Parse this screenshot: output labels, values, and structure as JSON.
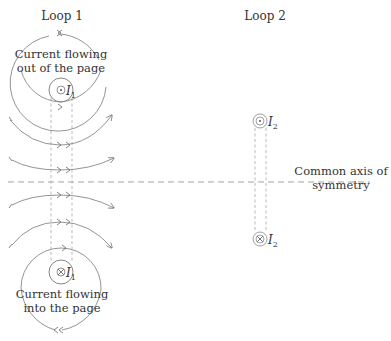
{
  "diagram": {
    "loop1": {
      "title": "Loop 1",
      "top_label_line1": "Current flowing",
      "top_label_line2": "out of the page",
      "bottom_label_line1": "Current flowing",
      "bottom_label_line2": "into the page",
      "top_current": "I",
      "top_current_sub": "1",
      "bottom_current": "I",
      "bottom_current_sub": "1",
      "top_symbol": "dot-in-circle (out of page)",
      "bottom_symbol": "cross-in-circle (into page)"
    },
    "loop2": {
      "title": "Loop 2",
      "top_current": "I",
      "top_current_sub": "2",
      "bottom_current": "I",
      "bottom_current_sub": "2",
      "top_symbol": "dot-in-circle (out of page)",
      "bottom_symbol": "cross-in-circle (into page)"
    },
    "axis": {
      "label_line1": "Common axis of",
      "label_line2": "symmetry"
    },
    "colors": {
      "line": "#777777",
      "dashed": "#999999",
      "text": "#333333"
    }
  }
}
